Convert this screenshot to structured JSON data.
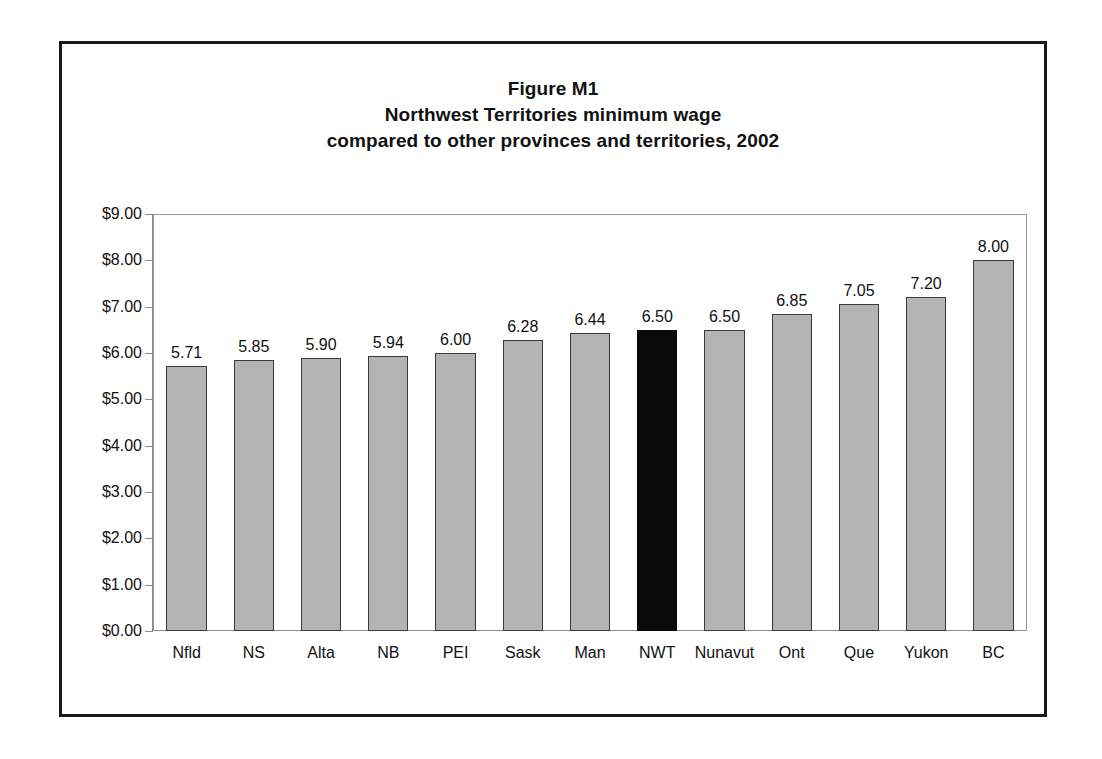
{
  "figure": {
    "title_lines": [
      "Figure M1",
      "Northwest Territories minimum wage",
      "compared to other provinces and territories, 2002"
    ]
  },
  "colors": {
    "bar_fill": "#b4b4b4",
    "bar_outline": "#3a3a3a",
    "highlight_fill": "#0a0a0a",
    "frame": "#1a1a1a",
    "axis": "#8a8a8a",
    "text": "#111111"
  },
  "chart_data": {
    "type": "bar",
    "xlabel": "",
    "ylabel": "",
    "ylim": [
      0,
      9
    ],
    "grid": false,
    "legend": "none",
    "highlight_category": "NWT",
    "y_ticks": [
      0,
      1,
      2,
      3,
      4,
      5,
      6,
      7,
      8,
      9
    ],
    "y_tick_labels": [
      "$0.00",
      "$1.00",
      "$2.00",
      "$3.00",
      "$4.00",
      "$5.00",
      "$6.00",
      "$7.00",
      "$8.00",
      "$9.00"
    ],
    "categories": [
      "Nfld",
      "NS",
      "Alta",
      "NB",
      "PEI",
      "Sask",
      "Man",
      "NWT",
      "Nunavut",
      "Ont",
      "Que",
      "Yukon",
      "BC"
    ],
    "values": [
      5.71,
      5.85,
      5.9,
      5.94,
      6.0,
      6.28,
      6.44,
      6.5,
      6.5,
      6.85,
      7.05,
      7.2,
      8.0
    ],
    "value_labels": [
      "5.71",
      "5.85",
      "5.90",
      "5.94",
      "6.00",
      "6.28",
      "6.44",
      "6.50",
      "6.50",
      "6.85",
      "7.05",
      "7.20",
      "8.00"
    ]
  }
}
